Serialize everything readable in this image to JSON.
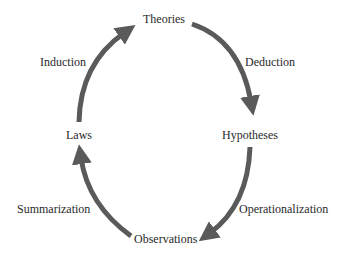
{
  "diagram": {
    "type": "cycle",
    "nodes": {
      "theories": "Theories",
      "hypotheses": "Hypotheses",
      "observations": "Observations",
      "laws": "Laws"
    },
    "edges": {
      "deduction": "Deduction",
      "operationalization": "Operationalization",
      "summarization": "Summarization",
      "induction": "Induction"
    },
    "flow": [
      {
        "from": "Theories",
        "to": "Hypotheses",
        "label": "Deduction"
      },
      {
        "from": "Hypotheses",
        "to": "Observations",
        "label": "Operationalization"
      },
      {
        "from": "Observations",
        "to": "Laws",
        "label": "Summarization"
      },
      {
        "from": "Laws",
        "to": "Theories",
        "label": "Induction"
      }
    ],
    "colors": {
      "arrow": "#5a5a5a",
      "text": "#2a2a2a",
      "background": "#ffffff"
    }
  }
}
